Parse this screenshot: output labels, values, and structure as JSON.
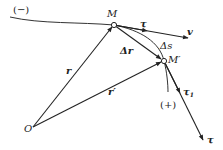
{
  "diagram": {
    "colors": {
      "stroke": "#222222",
      "background": "#ffffff"
    },
    "points": {
      "M": {
        "label": "M",
        "x": 114,
        "y": 25
      },
      "M_prime": {
        "label": "M′",
        "x": 164,
        "y": 61
      },
      "O": {
        "label": "O",
        "x": 33,
        "y": 127
      }
    },
    "curve": {
      "negative_label": "(−)",
      "positive_label": "(+)"
    },
    "vectors": {
      "r": "r",
      "r_prime": "r′",
      "delta_r": "Δr",
      "delta_s": "Δs",
      "tau": "τ",
      "v": "v",
      "tau1": "τ",
      "tau1_sub": "1",
      "tau_end": "τ"
    }
  }
}
